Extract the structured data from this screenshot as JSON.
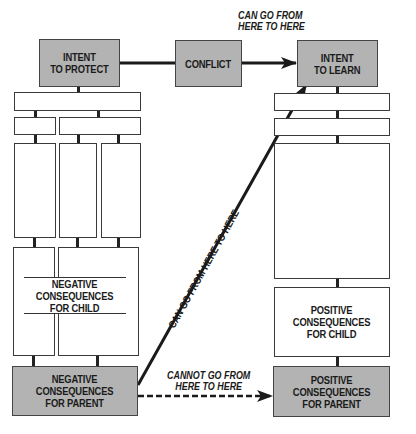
{
  "top_row": {
    "intent_to_protect": "INTENT\nTO PROTECT",
    "conflict": "CONFLICT",
    "intent_to_learn": "INTENT\nTO LEARN"
  },
  "annotations": {
    "top_arrow_note": "CAN GO FROM\nHERE TO HERE",
    "diagonal_arrow_note": "CAN GO FROM HERE TO HERE",
    "dashed_arrow_note": "CANNOT GO FROM\nHERE TO HERE"
  },
  "left_column": {
    "negative_consequences_child": "NEGATIVE\nCONSEQUENCES\nFOR CHILD",
    "negative_consequences_parent": "NEGATIVE\nCONSEQUENCES\nFOR PARENT"
  },
  "right_column": {
    "positive_consequences_child": "POSITIVE\nCONSEQUENCES\nFOR CHILD",
    "positive_consequences_parent": "POSITIVE\nCONSEQUENCES\nFOR PARENT"
  },
  "colors": {
    "box_fill_gray": "#b3b3b3",
    "box_fill_white": "#ffffff",
    "line": "#222222"
  }
}
